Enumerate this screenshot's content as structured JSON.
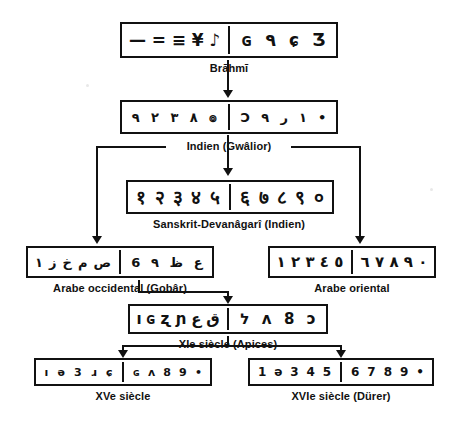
{
  "figure": {
    "footnote": ""
  },
  "rows": [
    {
      "id": "brahmi",
      "label": "Brāhmī",
      "box": {
        "x": 120,
        "y": 22,
        "w": 218,
        "h": 36
      },
      "left_glyphs": [
        "—",
        "=",
        "≡",
        "¥",
        "♪"
      ],
      "right_glyphs": [
        "ɢ",
        "٩",
        "ɕ",
        "Ʒ"
      ],
      "left_digits": [
        "1",
        "2",
        "3",
        "4",
        "5"
      ],
      "right_digits": [
        "6",
        "7",
        "8",
        "9"
      ],
      "glyph_size": 17
    },
    {
      "id": "gwalior",
      "label": "Indien (Gwâlior)",
      "box": {
        "x": 120,
        "y": 100,
        "w": 218,
        "h": 34
      },
      "left_glyphs": [
        "٩",
        "٢",
        "٣",
        "٨",
        "๏"
      ],
      "right_glyphs": [
        "Ɔ",
        "٩",
        "ر",
        "١",
        "•"
      ],
      "left_digits": [
        "1",
        "2",
        "3",
        "4",
        "5"
      ],
      "right_digits": [
        "6",
        "7",
        "8",
        "9",
        "0"
      ],
      "glyph_size": 13
    },
    {
      "id": "devanagari",
      "label": "Sanskrit-Devanâgarî (Indien)",
      "box": {
        "x": 126,
        "y": 180,
        "w": 208,
        "h": 34
      },
      "left_glyphs": [
        "१",
        "२",
        "३",
        "४",
        "५"
      ],
      "right_glyphs": [
        "६",
        "७",
        "८",
        "९",
        "०"
      ],
      "left_digits": [
        "1",
        "2",
        "3",
        "4",
        "5"
      ],
      "right_digits": [
        "6",
        "7",
        "8",
        "9",
        "0"
      ],
      "glyph_size": 19
    },
    {
      "id": "gobar",
      "label": "Arabe occidental (Gobâr)",
      "box": {
        "x": 26,
        "y": 246,
        "w": 188,
        "h": 32
      },
      "left_glyphs": [
        "١",
        "ز",
        "خ",
        "م",
        "ص"
      ],
      "right_glyphs": [
        "6",
        "٩",
        "ظ",
        "ع"
      ],
      "left_digits": [
        "1",
        "2",
        "3",
        "4",
        "5"
      ],
      "right_digits": [
        "6",
        "7",
        "8",
        "9"
      ],
      "glyph_size": 13
    },
    {
      "id": "oriental",
      "label": "Arabe oriental",
      "box": {
        "x": 268,
        "y": 246,
        "w": 168,
        "h": 32
      },
      "left_glyphs": [
        "١",
        "٢",
        "٣",
        "٤",
        "٥"
      ],
      "right_glyphs": [
        "٦",
        "٧",
        "٨",
        "٩",
        "٠"
      ],
      "left_digits": [
        "1",
        "2",
        "3",
        "4",
        "5"
      ],
      "right_digits": [
        "6",
        "7",
        "8",
        "9",
        "0"
      ],
      "glyph_size": 15
    },
    {
      "id": "apices",
      "label": "XIe siècle (Apices)",
      "box": {
        "x": 128,
        "y": 304,
        "w": 200,
        "h": 30
      },
      "left_glyphs": [
        "ı",
        "ɢ",
        "ʐ",
        "ɲ",
        "ع",
        "ق"
      ],
      "right_glyphs": [
        "ל",
        "ʌ",
        "8",
        "ɔ"
      ],
      "left_digits": [
        "1",
        "2",
        "3",
        "4",
        "5"
      ],
      "right_digits": [
        "6",
        "7",
        "8",
        "9"
      ],
      "glyph_size": 15
    },
    {
      "id": "xve",
      "label": "XVe siècle",
      "box": {
        "x": 34,
        "y": 358,
        "w": 178,
        "h": 28
      },
      "left_glyphs": [
        "ı",
        "ǝ",
        "3",
        "ɹ",
        "ɕ"
      ],
      "right_glyphs": [
        "ɢ",
        "ʌ",
        "8",
        "9",
        "•"
      ],
      "left_digits": [
        "1",
        "2",
        "3",
        "4",
        "5"
      ],
      "right_digits": [
        "6",
        "7",
        "8",
        "9",
        "0"
      ],
      "glyph_size": 11
    },
    {
      "id": "xvie",
      "label": "XVIe siècle (Dürer)",
      "box": {
        "x": 248,
        "y": 358,
        "w": 186,
        "h": 28
      },
      "left_glyphs": [
        "1",
        "ǝ",
        "3",
        "4",
        "5"
      ],
      "right_glyphs": [
        "6",
        "7",
        "8",
        "9",
        "•"
      ],
      "left_digits": [
        "1",
        "2",
        "3",
        "4",
        "5"
      ],
      "right_digits": [
        "6",
        "7",
        "8",
        "9",
        "0"
      ],
      "glyph_size": 12
    }
  ],
  "captions": {
    "brahmi": {
      "text": "Brāhmī",
      "x": 229,
      "y": 62
    },
    "gwalior": {
      "text": "Indien (Gwâlior)",
      "x": 229,
      "y": 140
    },
    "devanagari": {
      "text": "Sanskrit-Devanâgarî (Indien)",
      "x": 229,
      "y": 218
    },
    "gobar": {
      "text": "Arabe occidental (Gobâr)",
      "x": 120,
      "y": 282
    },
    "oriental": {
      "text": "Arabe oriental",
      "x": 352,
      "y": 282
    },
    "apices": {
      "text": "XIe siècle (Apices)",
      "x": 228,
      "y": 338
    },
    "xve": {
      "text": "XVe siècle",
      "x": 123,
      "y": 390
    },
    "xvie": {
      "text": "XVIe siècle (Dürer)",
      "x": 341,
      "y": 390
    }
  },
  "connectors": {
    "brahmi_to_gwalior": {
      "x": 228,
      "y": 76,
      "h": 16
    },
    "gwalior_stub_down": {
      "x": 228,
      "y": 136,
      "h": 8
    },
    "bus_left_x": 96,
    "bus_right_x": 359,
    "bus_y": 146,
    "bus_left_end": 208,
    "bus_right_start": 290,
    "center_down": {
      "x": 228,
      "y": 148,
      "h": 24
    },
    "left_drop": {
      "x": 96,
      "y": 146,
      "h": 92
    },
    "right_drop": {
      "x": 359,
      "y": 146,
      "h": 92
    },
    "gobar_to_apices": {
      "x": 96,
      "y": 280,
      "h": 16
    },
    "gobar_to_xve": {
      "x": 96,
      "y": 296,
      "h": 0
    },
    "apices_to_xve": {
      "x": 228,
      "y": 336,
      "h": 14
    }
  },
  "colors": {
    "ink": "#111111",
    "paper": "#ffffff"
  }
}
